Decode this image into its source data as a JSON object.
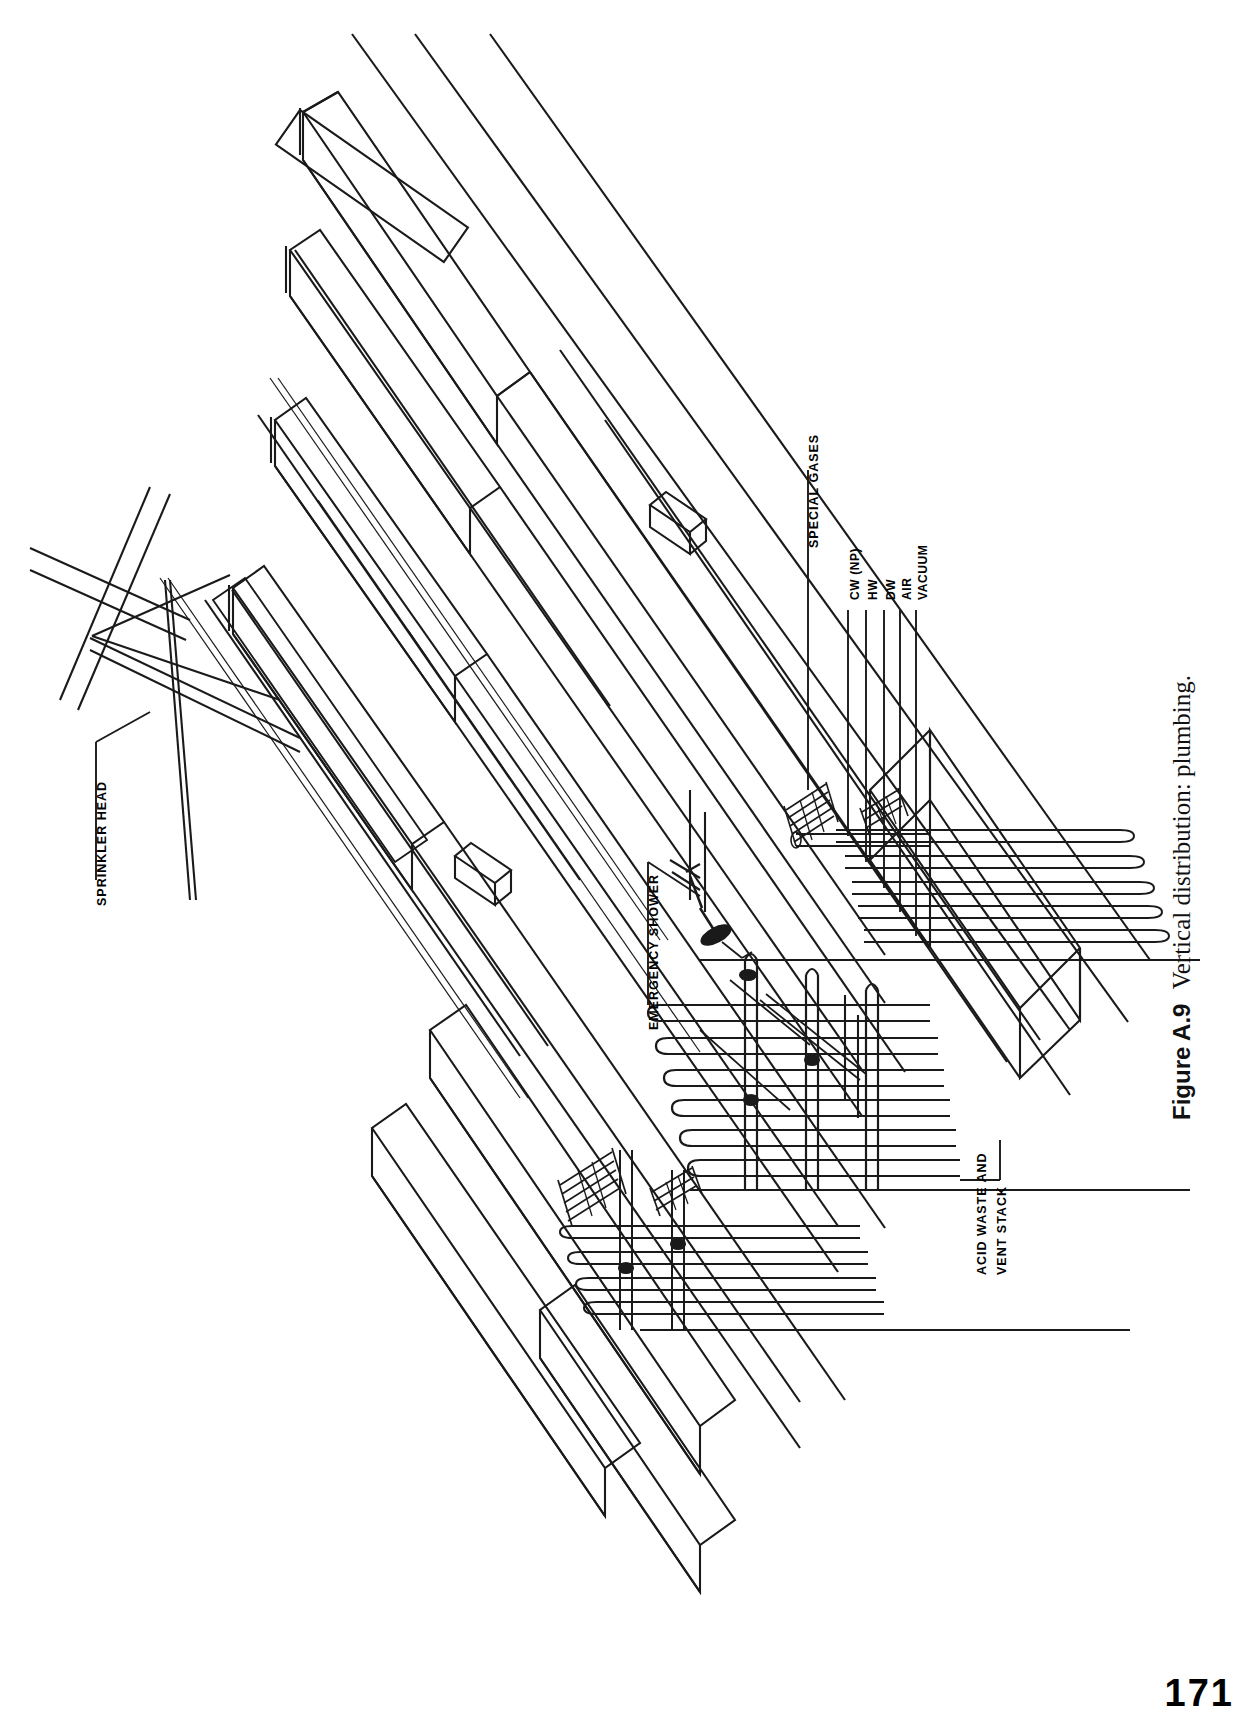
{
  "page": {
    "number": "171"
  },
  "caption": {
    "figure_number": "Figure A.9",
    "text": "Vertical distribution: plumbing."
  },
  "diagram": {
    "title": "Vertical distribution: plumbing",
    "type": "axonometric-architectural-section",
    "orientation": "rotated-90-ccw",
    "ink_color": "#1a1a1a",
    "background": "#ffffff",
    "callouts": [
      {
        "id": "sprinkler-head",
        "label": "SPRINKLER HEAD"
      },
      {
        "id": "emergency-shower",
        "label": "EMERGENCY SHOWER"
      },
      {
        "id": "special-gases",
        "label": "SPECIAL GASES"
      },
      {
        "id": "cw-np",
        "label": "CW (NP)"
      },
      {
        "id": "hw",
        "label": "HW"
      },
      {
        "id": "dw",
        "label": "DW"
      },
      {
        "id": "air",
        "label": "AIR"
      },
      {
        "id": "vacuum",
        "label": "VACUUM"
      },
      {
        "id": "acid-waste-vent-stack",
        "label": "ACID WASTE AND\nVENT STACK"
      }
    ],
    "acid_waste_line1": "ACID WASTE AND",
    "acid_waste_line2": "VENT STACK"
  }
}
